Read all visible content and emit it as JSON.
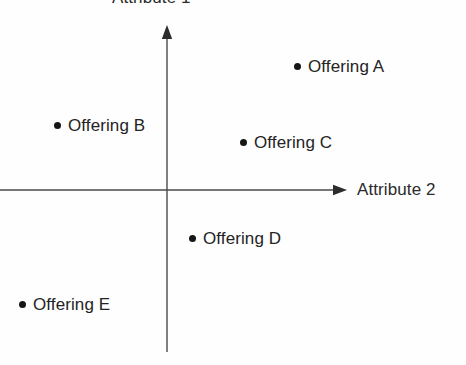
{
  "chart_data": {
    "type": "scatter",
    "title": "",
    "xlabel": "Attribute 2",
    "ylabel": "Attribute 1",
    "grid": false,
    "legend": "none",
    "axes_style": "arrowed-quadrant-cross",
    "origin_px": [
      167,
      190
    ],
    "xlim": [
      -167,
      299
    ],
    "ylim": [
      -175,
      190
    ],
    "categories": [
      "Offering A",
      "Offering B",
      "Offering C",
      "Offering D",
      "Offering E"
    ],
    "points": [
      {
        "label": "Offering A",
        "quadrant": "upper-right",
        "x": 127,
        "y": 124,
        "dot_px": [
          294,
          66
        ],
        "label_px": [
          304,
          58
        ]
      },
      {
        "label": "Offering B",
        "quadrant": "upper-left",
        "x": -113,
        "y": 65,
        "dot_px": [
          54,
          125
        ],
        "label_px": [
          64,
          117
        ]
      },
      {
        "label": "Offering C",
        "quadrant": "upper-right",
        "x": 73,
        "y": 48,
        "dot_px": [
          240,
          142
        ],
        "label_px": [
          250,
          134
        ]
      },
      {
        "label": "Offering D",
        "quadrant": "lower-right",
        "x": 22,
        "y": -48,
        "dot_px": [
          189,
          238
        ],
        "label_px": [
          199,
          230
        ]
      },
      {
        "label": "Offering E",
        "quadrant": "lower-left",
        "x": -148,
        "y": -114,
        "dot_px": [
          19,
          304
        ],
        "label_px": [
          29,
          296
        ]
      }
    ]
  },
  "axes": {
    "y_title": "Attribute 1",
    "x_title": "Attribute 2"
  },
  "colors": {
    "axis": "#4a4a4a",
    "point": "#161616",
    "text": "#232323",
    "background": "#fefefe"
  }
}
